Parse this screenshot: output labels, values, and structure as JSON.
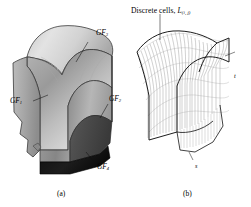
{
  "figure": {
    "background_color": "#ffffff",
    "ink_color": "#000000",
    "panels": [
      {
        "id": "a",
        "caption": "(a)",
        "kind": "shaded-solid-model",
        "description": "Grey shaded 3D solid of a doubly-curved saddle-shaped part with a dark bottom face",
        "surface_colors": {
          "highlight": "#e6e6e6",
          "midtone": "#b9b9b9",
          "shade": "#8f8f8f",
          "dark_face": "#4a4a4a",
          "bottom_face": "#141414",
          "outline": "#2b2b2b"
        },
        "labels": [
          {
            "name": "gf3",
            "text": "GF",
            "subscript": "3",
            "x": 96,
            "y": 29
          },
          {
            "name": "gf1",
            "text": "GF",
            "subscript": "1",
            "x": 10,
            "y": 97
          },
          {
            "name": "gf2",
            "text": "GF",
            "subscript": "2",
            "x": 109,
            "y": 95
          },
          {
            "name": "gf4",
            "text": "GF",
            "subscript": "4",
            "x": 97,
            "y": 163
          }
        ]
      },
      {
        "id": "b",
        "caption": "(b)",
        "kind": "wireframe-mesh-model",
        "description": "Line wireframe of the same saddle surface discretised into dense iso-parametric cells",
        "surface_colors": {
          "mesh_line": "#6e6e6e",
          "outline": "#111111",
          "fill": "#ffffff"
        },
        "annotation": {
          "name": "discrete-cells-annotation",
          "text": "Discrete cells,",
          "symbol": "L",
          "subscript": "(i, j)",
          "x": 131,
          "y": 6,
          "leader_from": [
            160,
            18
          ],
          "leader_to": [
            160,
            44
          ]
        },
        "axis_labels": [
          {
            "name": "axis-label-t",
            "text": "t",
            "x": 234,
            "y": 78
          },
          {
            "name": "axis-label-s",
            "text": "s",
            "x": 195,
            "y": 170
          }
        ]
      }
    ],
    "captions": [
      {
        "name": "caption-a",
        "text": "(a)",
        "x": 57,
        "y": 189
      },
      {
        "name": "caption-b",
        "text": "(b)",
        "x": 183,
        "y": 189
      }
    ]
  }
}
